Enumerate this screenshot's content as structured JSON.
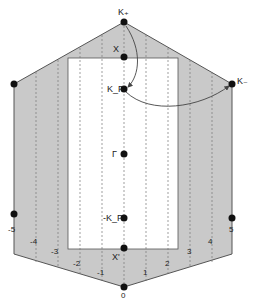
{
  "diagram": {
    "type": "hexagonal-brillouin-zone",
    "colors": {
      "shaded": "#c8c8c8",
      "outline": "#555555",
      "dashed": "#777777",
      "point": "#111111",
      "arrow": "#444444"
    },
    "points": [
      {
        "id": "K_plus",
        "label": "K₊"
      },
      {
        "id": "X",
        "label": "X"
      },
      {
        "id": "K_F",
        "label": "K_F"
      },
      {
        "id": "Gamma",
        "label": "Γ"
      },
      {
        "id": "neg_K_F",
        "label": "-K_F"
      },
      {
        "id": "X_prime",
        "label": "X'"
      },
      {
        "id": "K_minus",
        "label": "K₋"
      },
      {
        "id": "origin",
        "label": "0"
      }
    ],
    "axis_ticks_left": [
      "-5",
      "-4",
      "-3",
      "-2",
      "-1"
    ],
    "axis_ticks_right": [
      "1",
      "2",
      "3",
      "4",
      "5"
    ],
    "axis_tick_zero": "0",
    "arrows": [
      {
        "from": "K_plus",
        "to": "K_F"
      },
      {
        "from": "K_F",
        "to": "K_minus"
      }
    ]
  }
}
